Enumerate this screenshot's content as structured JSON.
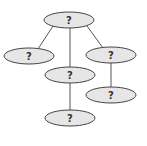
{
  "diagram": {
    "type": "tree",
    "colors": {
      "node_fill": "#e6e6e6",
      "node_stroke": "#444444",
      "edge": "#555555",
      "label": "#333333"
    },
    "nodes": [
      {
        "id": "root",
        "label": "?",
        "cx": 69,
        "cy": 20,
        "rx": 25,
        "ry": 8
      },
      {
        "id": "left",
        "label": "?",
        "cx": 29,
        "cy": 56,
        "rx": 25,
        "ry": 8
      },
      {
        "id": "middle",
        "label": "?",
        "cx": 70,
        "cy": 75,
        "rx": 25,
        "ry": 8
      },
      {
        "id": "right",
        "label": "?",
        "cx": 111,
        "cy": 55,
        "rx": 25,
        "ry": 8
      },
      {
        "id": "middle-child",
        "label": "?",
        "cx": 70,
        "cy": 118,
        "rx": 25,
        "ry": 8
      },
      {
        "id": "right-child",
        "label": "?",
        "cx": 111,
        "cy": 95,
        "rx": 25,
        "ry": 8
      }
    ],
    "edges": [
      {
        "from": "root",
        "to": "left"
      },
      {
        "from": "root",
        "to": "middle"
      },
      {
        "from": "root",
        "to": "right"
      },
      {
        "from": "middle",
        "to": "middle-child"
      },
      {
        "from": "right",
        "to": "right-child"
      }
    ]
  }
}
